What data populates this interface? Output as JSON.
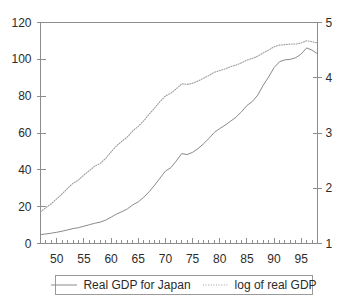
{
  "chart_data": {
    "type": "line",
    "title": "",
    "xlabel": "",
    "ylabel": "",
    "y2label": "",
    "grid": false,
    "legend_position": "bottom",
    "xlim": [
      1947,
      1998
    ],
    "ylim": [
      0,
      120
    ],
    "y2lim": [
      1,
      5
    ],
    "x_tick_labels": [
      "50",
      "55",
      "60",
      "65",
      "70",
      "75",
      "80",
      "85",
      "90",
      "95"
    ],
    "x_tick_values": [
      1950,
      1955,
      1960,
      1965,
      1970,
      1975,
      1980,
      1985,
      1990,
      1995
    ],
    "x_minor_tick_step": 1,
    "y_tick_labels": [
      "0",
      "20",
      "40",
      "60",
      "80",
      "100",
      "120"
    ],
    "y_tick_values": [
      0,
      20,
      40,
      60,
      80,
      100,
      120
    ],
    "y2_tick_labels": [
      "1",
      "2",
      "3",
      "4",
      "5"
    ],
    "y2_tick_values": [
      1,
      2,
      3,
      4,
      5
    ],
    "x": [
      1947,
      1948,
      1949,
      1950,
      1951,
      1952,
      1953,
      1954,
      1955,
      1956,
      1957,
      1958,
      1959,
      1960,
      1961,
      1962,
      1963,
      1964,
      1965,
      1966,
      1967,
      1968,
      1969,
      1970,
      1971,
      1972,
      1973,
      1974,
      1975,
      1976,
      1977,
      1978,
      1979,
      1980,
      1981,
      1982,
      1983,
      1984,
      1985,
      1986,
      1987,
      1988,
      1989,
      1990,
      1991,
      1992,
      1993,
      1994,
      1995,
      1996,
      1997,
      1998
    ],
    "series": [
      {
        "name": "Real GDP for Japan",
        "axis": "left",
        "style": "solid",
        "color": "#8a8a8a",
        "values": [
          4.8,
          5.2,
          5.6,
          6.1,
          6.7,
          7.4,
          8.1,
          8.6,
          9.4,
          10.2,
          11.0,
          11.6,
          12.7,
          14.3,
          16.0,
          17.3,
          18.8,
          21.0,
          22.6,
          25.1,
          28.1,
          31.6,
          35.5,
          39.3,
          41.2,
          44.8,
          48.8,
          48.3,
          49.5,
          51.5,
          54.1,
          57.0,
          60.3,
          62.4,
          64.3,
          66.4,
          68.6,
          71.5,
          74.9,
          77.1,
          80.6,
          85.9,
          90.4,
          95.5,
          98.7,
          99.7,
          100.0,
          100.9,
          102.9,
          106.2,
          105.0,
          103.0
        ]
      },
      {
        "name": "log of real GDP",
        "axis": "right",
        "style": "dotted",
        "color": "#9d9d9d",
        "values": [
          1.57,
          1.65,
          1.72,
          1.81,
          1.9,
          2.0,
          2.09,
          2.15,
          2.24,
          2.32,
          2.4,
          2.45,
          2.54,
          2.66,
          2.77,
          2.85,
          2.93,
          3.04,
          3.12,
          3.22,
          3.34,
          3.45,
          3.57,
          3.67,
          3.72,
          3.8,
          3.89,
          3.88,
          3.9,
          3.94,
          3.99,
          4.04,
          4.1,
          4.13,
          4.16,
          4.2,
          4.23,
          4.27,
          4.32,
          4.35,
          4.39,
          4.45,
          4.5,
          4.56,
          4.59,
          4.6,
          4.61,
          4.61,
          4.63,
          4.67,
          4.65,
          4.63
        ]
      }
    ]
  },
  "legend": {
    "entries": [
      {
        "label": "Real GDP for Japan",
        "style": "solid"
      },
      {
        "label": "log of real GDP",
        "style": "dotted"
      }
    ]
  },
  "colors": {
    "axis": "#8d8d8d",
    "text": "#2b2b2b",
    "series_solid": "#8a8a8a",
    "series_dotted": "#9d9d9d",
    "background": "#ffffff"
  }
}
